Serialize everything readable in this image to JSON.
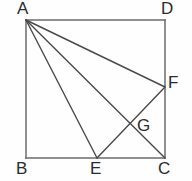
{
  "figure": {
    "canvas": {
      "width": 192,
      "height": 181
    },
    "style": {
      "background_color": "#fefefe",
      "stroke_color": "#4a4a4a",
      "square_stroke_color": "#6b6b6b",
      "label_color": "#2b2b2b",
      "stroke_width": 1.4,
      "label_font_size": 17
    },
    "points": {
      "A": {
        "label": "A",
        "x": 26,
        "y": 20,
        "label_x": 17,
        "label_y": 0,
        "role": "square-vertex-top-left"
      },
      "B": {
        "label": "B",
        "x": 26,
        "y": 158,
        "label_x": 16,
        "label_y": 160,
        "role": "square-vertex-bottom-left"
      },
      "C": {
        "label": "C",
        "x": 165,
        "y": 158,
        "label_x": 158,
        "label_y": 160,
        "role": "square-vertex-bottom-right"
      },
      "D": {
        "label": "D",
        "x": 165,
        "y": 20,
        "label_x": 161,
        "label_y": 0,
        "role": "square-vertex-top-right"
      },
      "E": {
        "label": "E",
        "x": 97,
        "y": 158,
        "label_x": 90,
        "label_y": 160,
        "role": "point-on-BC"
      },
      "F": {
        "label": "F",
        "x": 165,
        "y": 87,
        "label_x": 168,
        "label_y": 74,
        "role": "point-on-DC"
      },
      "G": {
        "label": "G",
        "x": 133,
        "y": 126,
        "label_x": 137,
        "label_y": 117,
        "role": "intersection-AC-EF"
      }
    },
    "square": {
      "name": "ABCD",
      "edges": [
        {
          "name": "AD",
          "from": "A",
          "to": "D"
        },
        {
          "name": "DC",
          "from": "D",
          "to": "C"
        },
        {
          "name": "CB",
          "from": "C",
          "to": "B"
        },
        {
          "name": "BA",
          "from": "B",
          "to": "A"
        }
      ]
    },
    "segments": [
      {
        "name": "AE",
        "from": "A",
        "to": "E"
      },
      {
        "name": "AC",
        "from": "A",
        "to": "C"
      },
      {
        "name": "AF",
        "from": "A",
        "to": "F"
      },
      {
        "name": "EF",
        "from": "E",
        "to": "F"
      }
    ],
    "vertex_labels": [
      "A",
      "B",
      "C",
      "D",
      "E",
      "F",
      "G"
    ]
  }
}
